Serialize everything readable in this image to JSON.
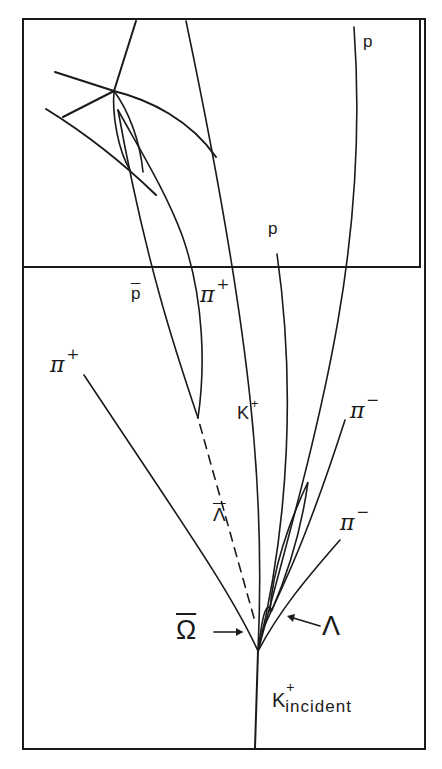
{
  "diagram": {
    "frame": {
      "stroke": "#1a1a1a",
      "background": "#ffffff"
    },
    "labels": {
      "p_top": "p",
      "p_mid": "p",
      "pbar": "p",
      "pi_plus_upper": "π",
      "pi_plus_upper_sup": "+",
      "pi_plus_left": "π",
      "pi_plus_left_sup": "+",
      "k_plus": "K",
      "k_plus_sup": "+",
      "pi_minus_upper": "π",
      "pi_minus_upper_sup": "−",
      "pi_minus_lower": "π",
      "pi_minus_lower_sup": "−",
      "lambda_bar": "Λ",
      "omega_bar": "Ω",
      "lambda": "Λ",
      "k_incident": "K",
      "k_incident_sup": "+",
      "k_incident_sub": "incident"
    },
    "tracks": [
      {
        "name": "k-incident-track",
        "particle": "K+ incident"
      },
      {
        "name": "omega-bar-decay",
        "particle": "anti-Omega"
      },
      {
        "name": "lambda-bar-dashed",
        "particle": "anti-Lambda (neutral, dashed)"
      },
      {
        "name": "pbar-track",
        "particle": "anti-proton"
      },
      {
        "name": "pi-plus-track",
        "particle": "pi+"
      },
      {
        "name": "k-plus-track",
        "particle": "K+"
      },
      {
        "name": "proton-track",
        "particle": "p"
      },
      {
        "name": "pi-minus-track",
        "particle": "pi-"
      },
      {
        "name": "lambda-track",
        "particle": "Lambda"
      }
    ]
  }
}
